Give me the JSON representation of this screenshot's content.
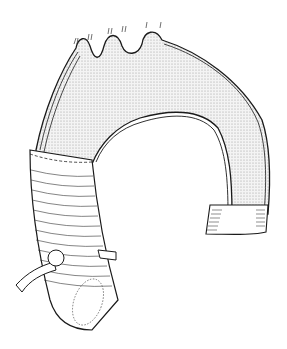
{
  "figure": {
    "colors": {
      "background": "#ffffff",
      "line": "#1a1a1a",
      "stipple": "#bdbdbd"
    }
  }
}
